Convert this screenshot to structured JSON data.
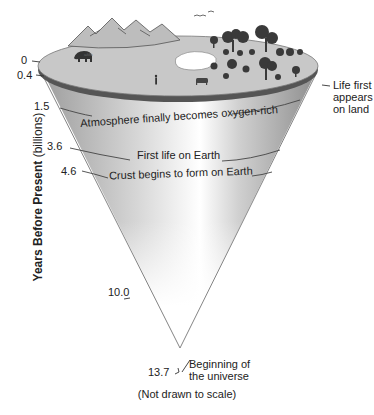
{
  "diagram": {
    "y_axis": {
      "label_bold": "Years Before Present",
      "label_unit": "(billions)"
    },
    "ticks": [
      {
        "value": "0",
        "event": ""
      },
      {
        "value": "0.4",
        "event": "Life first appears on land"
      },
      {
        "value": "1.5",
        "event": "Atmosphere finally becomes oxygen-rich"
      },
      {
        "value": "3.6",
        "event": "First life on Earth"
      },
      {
        "value": "4.6",
        "event": "Crust begins to form on Earth"
      },
      {
        "value": "10.0",
        "event": ""
      },
      {
        "value": "13.7",
        "event": "Beginning of the universe"
      }
    ],
    "labels": {
      "life_land_1": "Life first",
      "life_land_2": "appears",
      "life_land_3": "on land",
      "oxygen": "Atmosphere finally becomes oxygen-rich",
      "first_life": "First life on Earth",
      "crust": "Crust begins to form on Earth",
      "universe_1": "Beginning of",
      "universe_2": "the universe"
    },
    "footnote": "(Not drawn to scale)",
    "colors": {
      "cone_edge": "#8a8a8a",
      "cone_fill_dark": "#a8a8a8",
      "cone_fill_light": "#f4f4f4",
      "top_surface": "#c4c4c4",
      "rim": "#555555",
      "trees": "#3a3a3a"
    }
  }
}
